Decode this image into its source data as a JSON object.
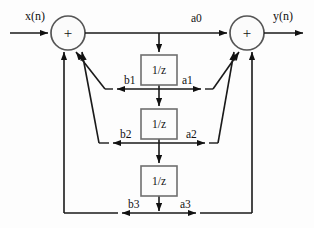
{
  "diagram": {
    "type": "signal-flow-graph",
    "colors": {
      "wire": "#1a1a1a",
      "node_stroke": "#555555",
      "box_stroke": "#6f6f6f",
      "background": "#ffffff",
      "text": "#111111"
    },
    "io": {
      "input_label": "x(n)",
      "output_label": "y(n)"
    },
    "adders": [
      {
        "id": "left-adder",
        "symbol": "+",
        "cx": 68,
        "cy": 33,
        "r": 17
      },
      {
        "id": "right-adder",
        "symbol": "+",
        "cx": 247,
        "cy": 33,
        "r": 17
      }
    ],
    "delays": [
      {
        "id": "delay-1",
        "label": "1/z",
        "x": 141,
        "y": 55,
        "w": 36,
        "h": 30
      },
      {
        "id": "delay-2",
        "label": "1/z",
        "x": 141,
        "y": 109,
        "w": 36,
        "h": 30
      },
      {
        "id": "delay-3",
        "label": "1/z",
        "x": 141,
        "y": 166,
        "w": 36,
        "h": 30
      }
    ],
    "feedforward_labels": [
      "a0",
      "a1",
      "a2",
      "a3"
    ],
    "feedback_labels": [
      "b1",
      "b2",
      "b3"
    ],
    "taps": [
      {
        "index": 0,
        "feedback": null,
        "feedforward": "a0",
        "y": 33
      },
      {
        "index": 1,
        "feedback": "b1",
        "feedforward": "a1",
        "y": 89
      },
      {
        "index": 2,
        "feedback": "b2",
        "feedforward": "a2",
        "y": 143
      },
      {
        "index": 3,
        "feedback": "b3",
        "feedforward": "a3",
        "y": 213
      }
    ]
  }
}
